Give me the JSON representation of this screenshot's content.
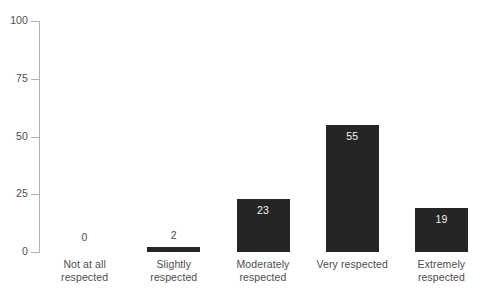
{
  "chart_data": {
    "type": "bar",
    "title": "",
    "subtitle": "",
    "xlabel": "",
    "ylabel": "",
    "categories": [
      "Not at all respected",
      "Slightly respected",
      "Moderately respected",
      "Very respected",
      "Extremely respected"
    ],
    "values": [
      0,
      2,
      23,
      55,
      19
    ],
    "value_labels": [
      "0",
      "2",
      "23",
      "55",
      "19"
    ],
    "ylim": [
      0,
      100
    ],
    "yticks": [
      0,
      25,
      50,
      75,
      100
    ],
    "ytick_labels": [
      "0",
      "25",
      "50",
      "75",
      "100"
    ],
    "grid": false,
    "legend": false,
    "legend_position": "none",
    "bar_color": "#252525",
    "axis_color": "#b0b0b0",
    "text_color": "#4d4d4d",
    "inside_label_color": "#f2f2f2",
    "background_color": "#ffffff"
  }
}
